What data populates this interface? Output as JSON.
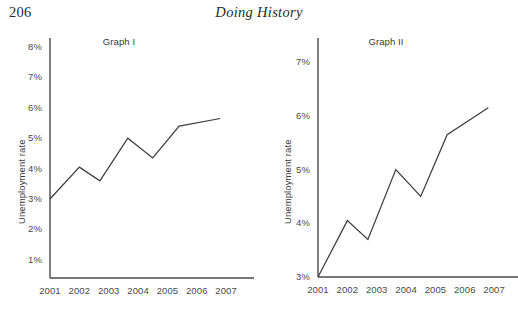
{
  "running_head": {
    "page_number": "206",
    "book_title": "Doing History"
  },
  "figure": {
    "charts": [
      {
        "key": "graph_i",
        "title": "Graph I",
        "y_axis_title": "Unemployment rate",
        "y_ticks": [
          "1%",
          "2%",
          "3%",
          "4%",
          "5%",
          "6%",
          "7%",
          "8%"
        ],
        "x_ticks": [
          "2001",
          "2002",
          "2003",
          "2004",
          "2005",
          "2006",
          "2007"
        ]
      },
      {
        "key": "graph_ii",
        "title": "Graph II",
        "y_axis_title": "Unemployment rate",
        "y_ticks": [
          "3%",
          "4%",
          "5%",
          "6%",
          "7%"
        ],
        "x_ticks": [
          "2001",
          "2002",
          "2003",
          "2004",
          "2005",
          "2006",
          "2007"
        ]
      }
    ]
  },
  "chart_data": [
    {
      "type": "line",
      "title": "Graph I",
      "xlabel": "",
      "ylabel": "Unemployment rate",
      "x": [
        2001,
        2002,
        2002.7,
        2003.65,
        2004.5,
        2005.4,
        2006.8
      ],
      "categories": [
        "2001",
        "2002",
        "2003",
        "2004",
        "2005",
        "2006",
        "2007"
      ],
      "values": [
        3.0,
        4.05,
        3.6,
        5.0,
        4.35,
        5.4,
        5.65
      ],
      "ytick_values": [
        1,
        2,
        3,
        4,
        5,
        6,
        7,
        8
      ],
      "ytick_labels": [
        "1%",
        "2%",
        "3%",
        "4%",
        "5%",
        "6%",
        "7%",
        "8%"
      ],
      "xtick_values": [
        2001,
        2002,
        2003,
        2004,
        2005,
        2006,
        2007
      ],
      "xtick_labels": [
        "2001",
        "2002",
        "2003",
        "2004",
        "2005",
        "2006",
        "2007"
      ],
      "ylim": [
        0.4,
        8.3
      ],
      "xlim": [
        2001,
        2007.2
      ],
      "grid": false,
      "legend": "none",
      "line_color": "#3d3d3d"
    },
    {
      "type": "line",
      "title": "Graph II",
      "xlabel": "",
      "ylabel": "Unemployment rate",
      "x": [
        2001,
        2002,
        2002.7,
        2003.65,
        2004.5,
        2005.4,
        2006.8
      ],
      "categories": [
        "2001",
        "2002",
        "2003",
        "2004",
        "2005",
        "2006",
        "2007"
      ],
      "values": [
        3.0,
        4.05,
        3.7,
        5.0,
        4.5,
        5.65,
        6.15
      ],
      "ytick_values": [
        3,
        4,
        5,
        6,
        7
      ],
      "ytick_labels": [
        "3%",
        "4%",
        "5%",
        "6%",
        "7%"
      ],
      "xtick_values": [
        2001,
        2002,
        2003,
        2004,
        2005,
        2006,
        2007
      ],
      "xtick_labels": [
        "2001",
        "2002",
        "2003",
        "2004",
        "2005",
        "2006",
        "2007"
      ],
      "ylim": [
        3.0,
        7.45
      ],
      "xlim": [
        2001,
        2007.2
      ],
      "grid": false,
      "legend": "none",
      "line_color": "#3d3d3d"
    }
  ]
}
